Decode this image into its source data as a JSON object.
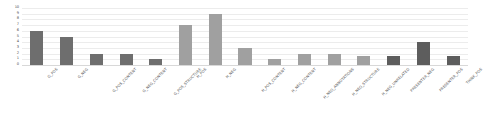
{
  "chart_data": {
    "type": "bar",
    "title": "",
    "xlabel": "",
    "ylabel": "",
    "ylim": [
      0,
      10
    ],
    "yticks": [
      0,
      1,
      2,
      3,
      4,
      5,
      6,
      7,
      8,
      9,
      10
    ],
    "ytick_labels": [
      "0",
      "1",
      "2",
      "3",
      "4",
      "5",
      "6",
      "7",
      "8",
      "9",
      "10"
    ],
    "grid": true,
    "legend": "none",
    "categories": [
      "G_POS",
      "G_NEG",
      "G_POS_CONTENT",
      "G_NEG_CONTENT",
      "G_POS_STRUCTURE",
      "H_POS",
      "H_NEG",
      "H_POS_CONTENT",
      "H_NEG_CONTENT",
      "H_NEG_ANNOTATIONS",
      "H_NEG_STRUCTURE",
      "H_NEG_UNRELATED",
      "PRESENTER_NEG",
      "PRESENTER_POS",
      "THINK_POS"
    ],
    "values": [
      6,
      5,
      2,
      2,
      1,
      7,
      9,
      3,
      1,
      2,
      2,
      1.5,
      1.5,
      4,
      1.5
    ],
    "bar_colors": [
      "#6e6e6e",
      "#6e6e6e",
      "#6e6e6e",
      "#6e6e6e",
      "#6e6e6e",
      "#a0a0a0",
      "#a0a0a0",
      "#a0a0a0",
      "#a0a0a0",
      "#a0a0a0",
      "#a0a0a0",
      "#a0a0a0",
      "#5d5d5d",
      "#5d5d5d",
      "#5d5d5d"
    ]
  },
  "style": {
    "background": "#ffffff",
    "gridline_color": "#ececec",
    "axis_color": "#d8d8d8",
    "tick_text_color": "#4a4a4a",
    "label_text_color": "#555555"
  }
}
